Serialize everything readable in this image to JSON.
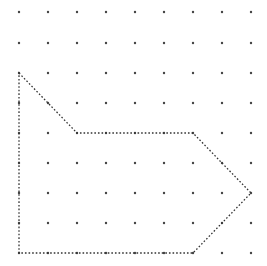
{
  "diagram": {
    "type": "dot-grid-polygon",
    "grid": {
      "columns": 9,
      "rows": 9,
      "x_positions": [
        19,
        48,
        77,
        106,
        135,
        164,
        193,
        222,
        251
      ],
      "y_positions": [
        12,
        43,
        73,
        103,
        133,
        163,
        193,
        223,
        253
      ],
      "dot_color": "#444444",
      "dot_radius": 1.2
    },
    "polygon": {
      "vertices_grid": [
        [
          0,
          2
        ],
        [
          2,
          4
        ],
        [
          6,
          4
        ],
        [
          8,
          6
        ],
        [
          6,
          8
        ],
        [
          0,
          8
        ]
      ],
      "stroke_color": "#333333",
      "stroke_style": "dotted",
      "fill": "none"
    }
  }
}
